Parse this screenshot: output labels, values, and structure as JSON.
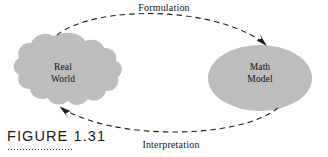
{
  "figure": {
    "caption": "FIGURE 1.31",
    "nodes": [
      {
        "id": "real-world",
        "label": "Real\nWorld",
        "shape": "cloud-blob",
        "fill": "#bdbdbd"
      },
      {
        "id": "math-model",
        "label": "Math\nModel",
        "shape": "ellipse",
        "fill": "#bdbdbd"
      }
    ],
    "edges": [
      {
        "id": "formulation",
        "label": "Formulation",
        "from": "real-world",
        "to": "math-model",
        "style": "dashed",
        "direction": "rightward-arc-above",
        "color": "#1f1f1f"
      },
      {
        "id": "interpretation",
        "label": "Interpretation",
        "from": "math-model",
        "to": "real-world",
        "style": "dashed",
        "direction": "leftward-arc-below",
        "color": "#1f1f1f"
      }
    ],
    "background": "#ffffff"
  }
}
